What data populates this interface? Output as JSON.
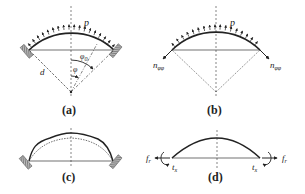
{
  "figure": {
    "panels": [
      {
        "id": "a",
        "label": "(a)",
        "load_label": "p",
        "radius_label": "d",
        "angle_label": "φ",
        "angle0_label": "φ",
        "angle0_sub": "0",
        "description": "Clamped spherical cap under uniform outward pressure"
      },
      {
        "id": "b",
        "label": "(b)",
        "load_label": "p",
        "edge_force_label": "n",
        "edge_force_sub": "φφ",
        "description": "Free body with meridional membrane force at edges"
      },
      {
        "id": "c",
        "label": "(c)",
        "description": "Clamped cap deformed vs. undeformed shape"
      },
      {
        "id": "d",
        "label": "(d)",
        "radial_force_label": "f",
        "radial_force_sub": "r",
        "moment_label": "t",
        "moment_sub": "x",
        "description": "Edge radial force and moment reactions"
      }
    ],
    "colors": {
      "stroke": "#222222",
      "support": "#666666",
      "background": "#ffffff"
    }
  }
}
